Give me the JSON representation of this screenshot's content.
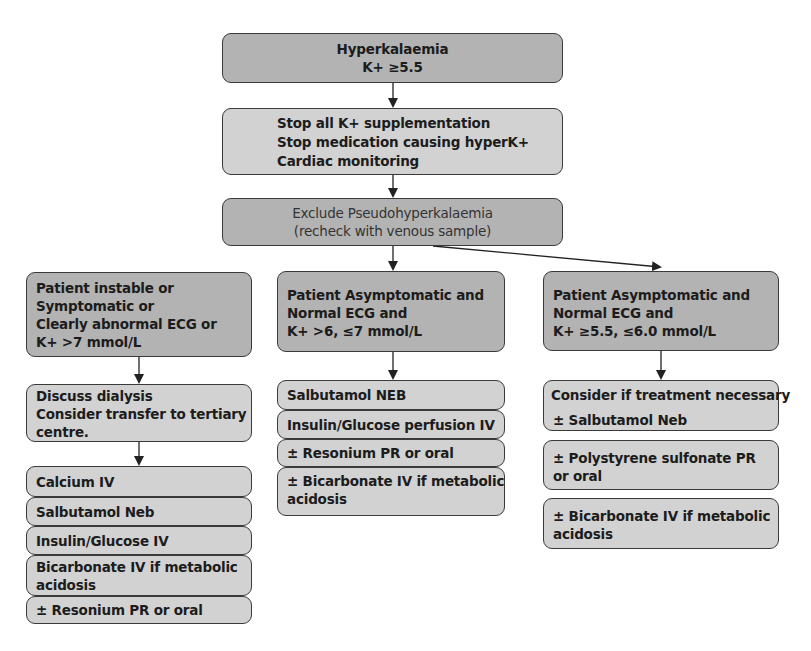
{
  "title_box": {
    "lines": [
      "Hyperkalaemia",
      "K+ ≥5.5"
    ]
  },
  "initial_actions": {
    "lines": [
      "Stop all K+ supplementation",
      "Stop medication causing hyperK+",
      "Cardiac monitoring"
    ]
  },
  "exclude_box": {
    "lines": [
      "Exclude Pseudohyperkalaemia",
      "(recheck with venous sample)"
    ]
  },
  "branches": [
    {
      "condition": [
        "Patient instable or",
        "Symptomatic or",
        "Clearly abnormal ECG or",
        "K+ >7 mmol/L"
      ],
      "pre_step": [
        "Discuss dialysis",
        "Consider transfer to tertiary",
        "centre."
      ],
      "treatments": [
        [
          "Calcium IV"
        ],
        [
          "Salbutamol Neb"
        ],
        [
          "Insulin/Glucose IV"
        ],
        [
          "Bicarbonate IV if metabolic",
          "acidosis"
        ],
        [
          "± Resonium PR or oral"
        ]
      ]
    },
    {
      "condition": [
        "Patient Asymptomatic and",
        "Normal ECG and",
        "K+ >6, ≤7 mmol/L"
      ],
      "treatments": [
        [
          "Salbutamol NEB"
        ],
        [
          "Insulin/Glucose perfusion IV"
        ],
        [
          "± Resonium PR or oral"
        ],
        [
          "± Bicarbonate IV if metabolic",
          "acidosis"
        ]
      ]
    },
    {
      "condition": [
        "Patient Asymptomatic and",
        "Normal ECG and",
        "K+ ≥5.5, ≤6.0 mmol/L"
      ],
      "treatments": [
        [
          "Consider if treatment necessary",
          "± Salbutamol Neb"
        ],
        [
          "± Polystyrene sulfonate PR",
          "or oral"
        ],
        [
          "± Bicarbonate IV if metabolic",
          "acidosis"
        ]
      ]
    }
  ],
  "colors": {
    "dark_box": "#b3b3b3",
    "light_box": "#d2d2d2",
    "border": "#3a3a3a",
    "arrow": "#222222"
  }
}
